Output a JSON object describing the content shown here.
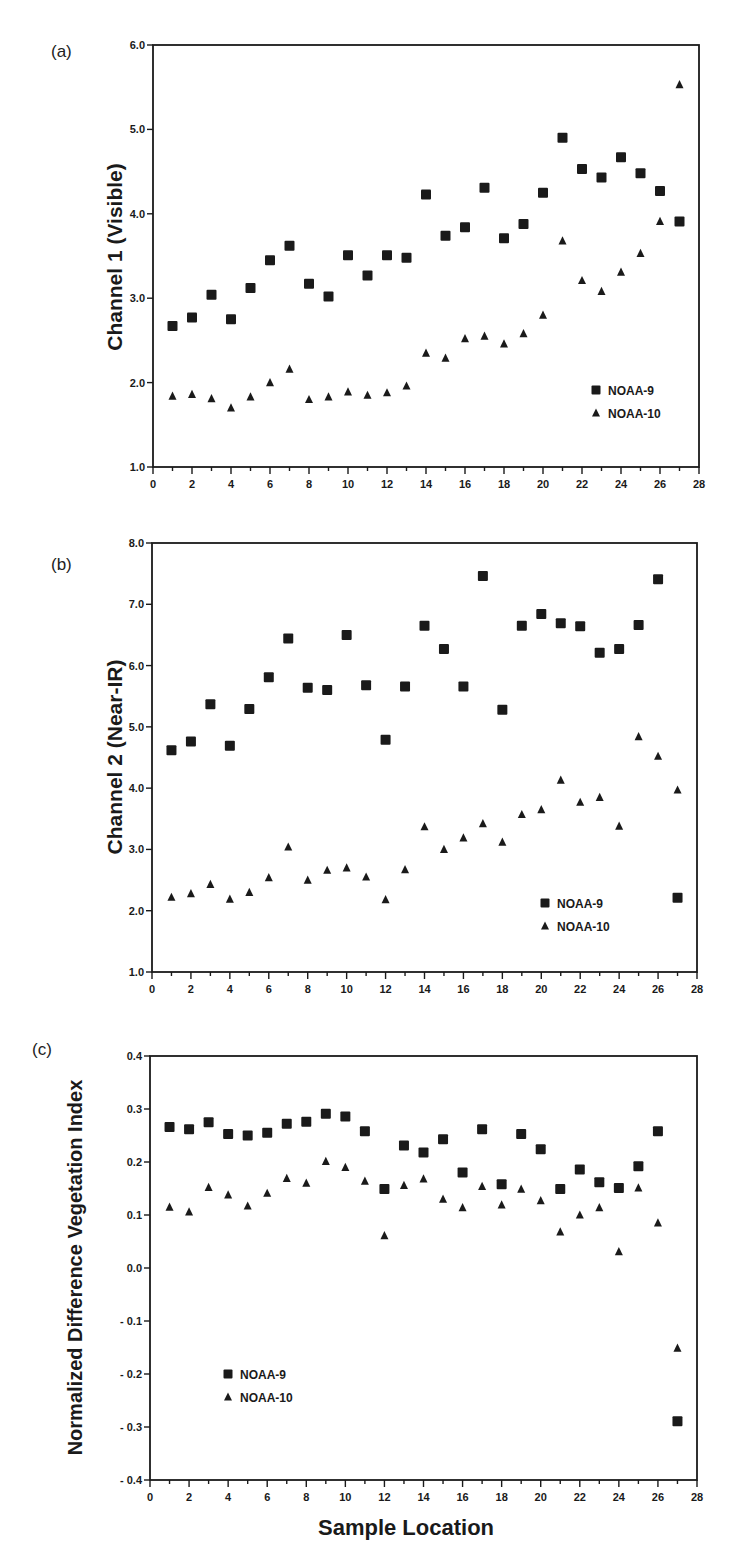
{
  "chart_data": [
    {
      "panel": "(a)",
      "type": "scatter",
      "title": "",
      "xlabel": "",
      "ylabel": "Channel 1 (Visible)",
      "xlim": [
        0,
        28
      ],
      "ylim": [
        1.0,
        6.0
      ],
      "x_ticks": [
        0,
        2,
        4,
        6,
        8,
        10,
        12,
        14,
        16,
        18,
        20,
        22,
        24,
        26,
        28
      ],
      "y_ticks": [
        "1.0",
        "2.0",
        "3.0",
        "4.0",
        "5.0",
        "6.0"
      ],
      "grid": false,
      "legend_position": "lower right",
      "x": [
        1,
        2,
        3,
        4,
        5,
        6,
        7,
        8,
        9,
        10,
        11,
        12,
        13,
        14,
        15,
        16,
        17,
        18,
        19,
        20,
        21,
        22,
        23,
        24,
        25,
        26,
        27
      ],
      "series": [
        {
          "name": "NOAA-9",
          "marker": "square",
          "values": [
            2.67,
            2.77,
            3.04,
            2.75,
            3.12,
            3.45,
            3.62,
            3.17,
            3.02,
            3.51,
            3.27,
            3.51,
            3.48,
            4.23,
            3.74,
            3.84,
            4.31,
            3.71,
            3.88,
            4.25,
            4.9,
            4.53,
            4.43,
            4.67,
            4.48,
            4.27,
            3.91
          ]
        },
        {
          "name": "NOAA-10",
          "marker": "triangle",
          "values": [
            1.84,
            1.86,
            1.81,
            1.7,
            1.83,
            2.0,
            2.16,
            1.8,
            1.83,
            1.89,
            1.85,
            1.88,
            1.96,
            2.35,
            2.29,
            2.52,
            2.55,
            2.46,
            2.58,
            2.8,
            3.68,
            3.21,
            3.08,
            3.31,
            3.53,
            3.91,
            5.53
          ]
        }
      ]
    },
    {
      "panel": "(b)",
      "type": "scatter",
      "title": "",
      "xlabel": "",
      "ylabel": "Channel 2 (Near-IR)",
      "xlim": [
        0,
        28
      ],
      "ylim": [
        1.0,
        8.0
      ],
      "x_ticks": [
        0,
        2,
        4,
        6,
        8,
        10,
        12,
        14,
        16,
        18,
        20,
        22,
        24,
        26,
        28
      ],
      "y_ticks": [
        "1.0",
        "2.0",
        "3.0",
        "4.0",
        "5.0",
        "6.0",
        "7.0",
        "8.0"
      ],
      "grid": false,
      "legend_position": "lower right",
      "x": [
        1,
        2,
        3,
        4,
        5,
        6,
        7,
        8,
        9,
        10,
        11,
        12,
        13,
        14,
        15,
        16,
        17,
        18,
        19,
        20,
        21,
        22,
        23,
        24,
        25,
        26,
        27
      ],
      "series": [
        {
          "name": "NOAA-9",
          "marker": "square",
          "values": [
            4.62,
            4.76,
            5.37,
            4.69,
            5.29,
            5.81,
            6.44,
            5.64,
            5.6,
            6.5,
            5.68,
            4.79,
            5.66,
            6.65,
            6.27,
            5.66,
            7.46,
            5.28,
            6.65,
            6.84,
            6.69,
            6.64,
            6.21,
            6.27,
            6.66,
            7.41,
            2.21
          ]
        },
        {
          "name": "NOAA-10",
          "marker": "triangle",
          "values": [
            2.22,
            2.28,
            2.43,
            2.19,
            2.3,
            2.54,
            3.04,
            2.5,
            2.66,
            2.7,
            2.55,
            2.18,
            2.67,
            3.37,
            3.0,
            3.19,
            3.42,
            3.12,
            3.57,
            3.65,
            4.13,
            3.77,
            3.85,
            3.38,
            4.84,
            4.52,
            3.97
          ]
        }
      ]
    },
    {
      "panel": "(c)",
      "type": "scatter",
      "title": "",
      "xlabel": "Sample Location",
      "ylabel": "Normalized Difference Vegetation Index",
      "xlim": [
        0,
        28
      ],
      "ylim": [
        -0.4,
        0.4
      ],
      "x_ticks": [
        0,
        2,
        4,
        6,
        8,
        10,
        12,
        14,
        16,
        18,
        20,
        22,
        24,
        26,
        28
      ],
      "y_ticks": [
        "- 0.4",
        "- 0.3",
        "- 0.2",
        "- 0.1",
        "0.0",
        "0.1",
        "0.2",
        "0.3",
        "0.4"
      ],
      "grid": false,
      "legend_position": "lower left",
      "x": [
        1,
        2,
        3,
        4,
        5,
        6,
        7,
        8,
        9,
        10,
        11,
        12,
        13,
        14,
        15,
        16,
        17,
        18,
        19,
        20,
        21,
        22,
        23,
        24,
        25,
        26,
        27
      ],
      "series": [
        {
          "name": "NOAA-9",
          "marker": "square",
          "values": [
            0.266,
            0.262,
            0.275,
            0.253,
            0.25,
            0.255,
            0.272,
            0.276,
            0.291,
            0.286,
            0.258,
            0.149,
            0.231,
            0.218,
            0.243,
            0.18,
            0.262,
            0.158,
            0.253,
            0.224,
            0.149,
            0.186,
            0.162,
            0.151,
            0.192,
            0.258,
            -0.289
          ]
        },
        {
          "name": "NOAA-10",
          "marker": "triangle",
          "values": [
            0.115,
            0.106,
            0.152,
            0.138,
            0.117,
            0.141,
            0.169,
            0.16,
            0.201,
            0.19,
            0.164,
            0.061,
            0.156,
            0.168,
            0.13,
            0.114,
            0.154,
            0.119,
            0.149,
            0.127,
            0.068,
            0.1,
            0.114,
            0.031,
            0.151,
            0.085,
            -0.151
          ]
        }
      ]
    }
  ],
  "panels": {
    "a": {
      "label": "(a)",
      "ylabel": "Channel 1 (Visible)"
    },
    "b": {
      "label": "(b)",
      "ylabel": "Channel 2 (Near-IR)"
    },
    "c": {
      "label": "(c)",
      "ylabel": "Normalized Difference Vegetation Index",
      "xlabel": "Sample Location"
    }
  },
  "legend": {
    "series1": "NOAA-9",
    "series2": "NOAA-10"
  },
  "colors": {
    "ink": "#1a1a1a",
    "background": "#ffffff"
  }
}
